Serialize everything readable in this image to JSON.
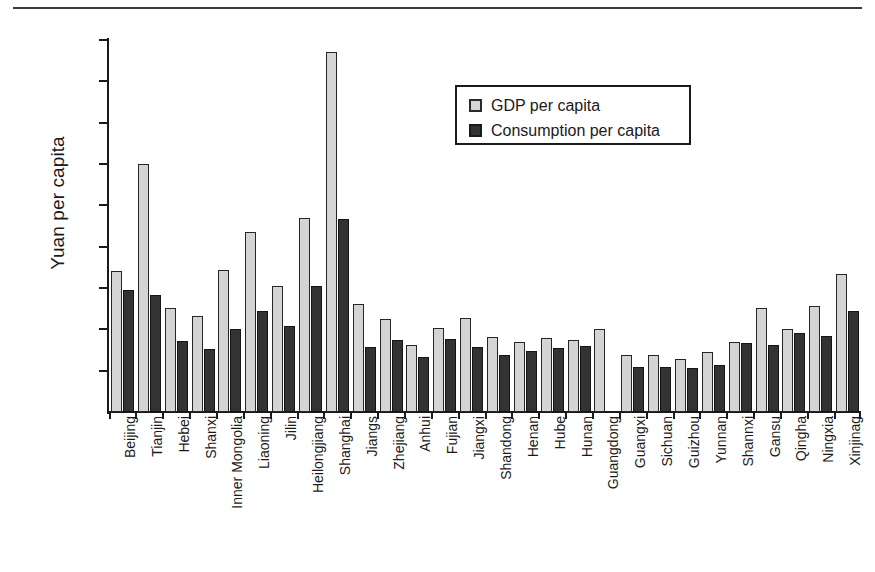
{
  "figure": {
    "has_top_rule": true,
    "background_color": "#ffffff"
  },
  "legend": {
    "position": "inside-top-right",
    "entries": [
      {
        "label": "GDP per capita",
        "color": "#d4d4d4",
        "swatch_name": "legend-swatch-gdp"
      },
      {
        "label": "Consumption per capita",
        "color": "#333333",
        "swatch_name": "legend-swatch-consumption"
      }
    ]
  },
  "chart_data": {
    "type": "bar",
    "title": "",
    "subtitle": "",
    "xlabel": "",
    "ylabel": "Yuan per capita",
    "ylim": [
      0,
      450
    ],
    "yticks": [
      0,
      50,
      100,
      150,
      200,
      250,
      300,
      350,
      400,
      450
    ],
    "ytick_labels": [
      "0",
      "50",
      "100",
      "150",
      "200",
      "250",
      "300",
      "350",
      "400",
      "450"
    ],
    "grid": false,
    "legend_position": "upper right",
    "categories": [
      "Beijing",
      "Tianjin",
      "Hebei",
      "Shanxi",
      "Inner Mongolia",
      "Liaoning",
      "Jilin",
      "Heilongjiang",
      "Shanghai",
      "Jiangs",
      "Zhejiang",
      "Anhui",
      "Fujian",
      "Jiangxi",
      "Shandong",
      "Henan",
      "Hube",
      "Hunan",
      "Guangdong",
      "Guangxi",
      "Sichuan",
      "Guizhou",
      "Yunnan",
      "Shannxi",
      "Gansu",
      "Qingha",
      "Ningxia",
      "Xinjinag"
    ],
    "series": [
      {
        "name": "GDP per capita",
        "color": "#d4d4d4",
        "values": [
          170,
          300,
          126,
          116,
          172,
          218,
          153,
          235,
          435,
          131,
          112,
          81,
          102,
          114,
          91,
          85,
          90,
          87,
          101,
          69,
          69,
          64,
          72,
          85,
          126,
          101,
          128,
          167
        ]
      },
      {
        "name": "Consumption per capita",
        "color": "#333333",
        "values": [
          148,
          142,
          86,
          76,
          100,
          122,
          104,
          152,
          233,
          79,
          87,
          67,
          88,
          79,
          69,
          74,
          78,
          80,
          null,
          54,
          55,
          53,
          57,
          83,
          81,
          96,
          92,
          122
        ]
      }
    ]
  }
}
